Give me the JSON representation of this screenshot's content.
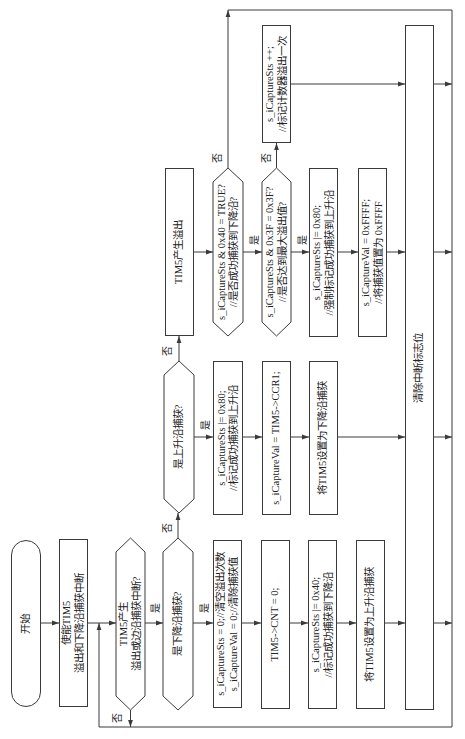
{
  "flowchart": {
    "nodes": {
      "start": {
        "type": "terminal",
        "lines": [
          "开始"
        ]
      },
      "enable_interrupts": {
        "type": "process",
        "lines": [
          "使能TIM5",
          "溢出和下降沿捕获中断"
        ]
      },
      "irq_occurred": {
        "type": "decision",
        "lines": [
          "TIM5产生",
          "溢出或边沿捕获中断?"
        ]
      },
      "is_falling_edge": {
        "type": "decision",
        "lines": [
          "是下降沿捕获?"
        ]
      },
      "reset_values": {
        "type": "process",
        "lines": [
          "s_iCaptureSts = 0;//清空溢出次数",
          "s_iCaptureVal = 0;//清除捕获值"
        ]
      },
      "reset_counter": {
        "type": "process",
        "lines": [
          "TIM5->CNT = 0;"
        ]
      },
      "mark_falling": {
        "type": "process",
        "lines": [
          "s_iCaptureSts |= 0x40;",
          "//标记成功捕获到下降沿"
        ]
      },
      "set_rising": {
        "type": "process",
        "lines": [
          "将TIM5设置为上升沿捕获"
        ]
      },
      "clear_flag": {
        "type": "process",
        "lines": [
          "清除中断标志位"
        ]
      },
      "is_rising_edge": {
        "type": "decision",
        "lines": [
          "是上升沿捕获?"
        ]
      },
      "mark_rising": {
        "type": "process",
        "lines": [
          "s_iCaptureSts |= 0x80;",
          "//标记成功捕获到上升沿"
        ]
      },
      "read_ccr1": {
        "type": "process",
        "lines": [
          "s_iCaptureVal = TIM5->CCR1;"
        ]
      },
      "set_falling": {
        "type": "process",
        "lines": [
          "将TIM5设置为下降沿捕获"
        ]
      },
      "overflow": {
        "type": "process",
        "lines": [
          "TIM5产生溢出"
        ]
      },
      "check_falling_captured": {
        "type": "decision",
        "lines": [
          "s_iCaptureSts & 0x40 = TRUE?",
          "//是否成功捕获到下降沿?"
        ]
      },
      "check_max_overflow": {
        "type": "decision",
        "lines": [
          "s_iCaptureSts & 0x3F = 0x3F?",
          "//是否达到最大溢出值?"
        ]
      },
      "force_rising": {
        "type": "process",
        "lines": [
          "s_iCaptureSts |= 0x80;",
          "//强制标记成功捕获到上升沿"
        ]
      },
      "set_max_value": {
        "type": "process",
        "lines": [
          "s_iCaptureVal = 0xFFFF;",
          "//将捕获值置为 0xFFFF"
        ]
      },
      "increment_overflow": {
        "type": "process",
        "lines": [
          "s_iCaptureSts ++;",
          "//标记计数器溢出一次"
        ]
      }
    },
    "edges": [
      {
        "from": "start",
        "to": "enable_interrupts",
        "label": ""
      },
      {
        "from": "enable_interrupts",
        "to": "irq_occurred",
        "label": ""
      },
      {
        "from": "irq_occurred",
        "to": "is_falling_edge",
        "label": "是"
      },
      {
        "from": "irq_occurred",
        "to": "irq_occurred",
        "label": "否"
      },
      {
        "from": "is_falling_edge",
        "to": "reset_values",
        "label": "是"
      },
      {
        "from": "is_falling_edge",
        "to": "is_rising_edge",
        "label": "否"
      },
      {
        "from": "reset_values",
        "to": "reset_counter",
        "label": ""
      },
      {
        "from": "reset_counter",
        "to": "mark_falling",
        "label": ""
      },
      {
        "from": "mark_falling",
        "to": "set_rising",
        "label": ""
      },
      {
        "from": "set_rising",
        "to": "clear_flag",
        "label": ""
      },
      {
        "from": "is_rising_edge",
        "to": "mark_rising",
        "label": "是"
      },
      {
        "from": "is_rising_edge",
        "to": "overflow",
        "label": "否"
      },
      {
        "from": "mark_rising",
        "to": "read_ccr1",
        "label": ""
      },
      {
        "from": "read_ccr1",
        "to": "set_falling",
        "label": ""
      },
      {
        "from": "set_falling",
        "to": "clear_flag",
        "label": ""
      },
      {
        "from": "overflow",
        "to": "check_falling_captured",
        "label": ""
      },
      {
        "from": "check_falling_captured",
        "to": "check_max_overflow",
        "label": "是"
      },
      {
        "from": "check_falling_captured",
        "to": "irq_occurred",
        "label": "否"
      },
      {
        "from": "check_max_overflow",
        "to": "force_rising",
        "label": "是"
      },
      {
        "from": "check_max_overflow",
        "to": "increment_overflow",
        "label": "否"
      },
      {
        "from": "force_rising",
        "to": "set_max_value",
        "label": ""
      },
      {
        "from": "set_max_value",
        "to": "clear_flag",
        "label": ""
      },
      {
        "from": "increment_overflow",
        "to": "clear_flag",
        "label": ""
      },
      {
        "from": "clear_flag",
        "to": "irq_occurred",
        "label": ""
      }
    ]
  }
}
